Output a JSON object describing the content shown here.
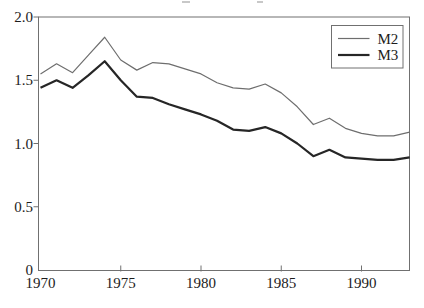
{
  "figure": {
    "background": "#ffffff"
  },
  "legend": {
    "items": [
      {
        "label": "M2",
        "weight": "thin"
      },
      {
        "label": "M3",
        "weight": "thick"
      }
    ]
  },
  "chart_data": {
    "type": "line",
    "title": "",
    "xlabel": "",
    "ylabel": "",
    "grid": false,
    "legend_position": "top-right",
    "xlim": [
      1970,
      1993
    ],
    "ylim": [
      0,
      2.0
    ],
    "x": [
      1970,
      1971,
      1972,
      1973,
      1974,
      1975,
      1976,
      1977,
      1978,
      1979,
      1980,
      1981,
      1982,
      1983,
      1984,
      1985,
      1986,
      1987,
      1988,
      1989,
      1990,
      1991,
      1992,
      1993
    ],
    "series": [
      {
        "name": "M2",
        "color": "#6e6e6e",
        "stroke_width": 1.2,
        "values": [
          1.55,
          1.63,
          1.56,
          1.7,
          1.84,
          1.66,
          1.58,
          1.64,
          1.63,
          1.59,
          1.55,
          1.48,
          1.44,
          1.43,
          1.47,
          1.4,
          1.29,
          1.15,
          1.2,
          1.12,
          1.08,
          1.06,
          1.06,
          1.09
        ]
      },
      {
        "name": "M3",
        "color": "#262626",
        "stroke_width": 2.2,
        "values": [
          1.44,
          1.5,
          1.44,
          1.54,
          1.65,
          1.5,
          1.37,
          1.36,
          1.31,
          1.27,
          1.23,
          1.18,
          1.11,
          1.1,
          1.13,
          1.08,
          1.0,
          0.9,
          0.95,
          0.89,
          0.88,
          0.87,
          0.87,
          0.89
        ]
      }
    ],
    "yticks": {
      "values": [
        0,
        0.5,
        1.0,
        1.5,
        2.0
      ],
      "labels": [
        "0",
        "0.5",
        "1.0",
        "1.5",
        "2.0"
      ]
    },
    "xticks": {
      "values": [
        1970,
        1975,
        1980,
        1985,
        1990
      ],
      "labels": [
        "1970",
        "1975",
        "1980",
        "1985",
        "1990"
      ]
    }
  },
  "colors": {
    "axis": "#707070",
    "tick": "#707070",
    "legend_border": "#707070",
    "text": "#1c1c1c"
  }
}
